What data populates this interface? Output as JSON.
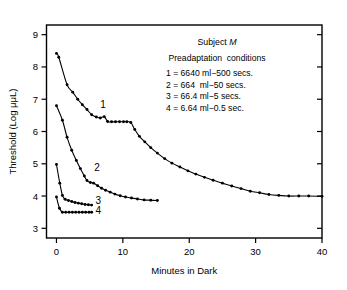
{
  "chart_data": {
    "type": "line",
    "title": "",
    "xlabel": "Minutes in Dark",
    "ylabel": "Threshold (Log μμL)",
    "xlim": [
      -1.5,
      40
    ],
    "ylim": [
      2.7,
      9.3
    ],
    "xticks": [
      0,
      10,
      20,
      30,
      40
    ],
    "yticks": [
      3,
      4,
      5,
      6,
      7,
      8,
      9
    ],
    "grid": false,
    "legend_position": "upper-right-inside",
    "marker": "filled-circle",
    "series": [
      {
        "name": "1",
        "label": "1 = 6640 ml−500 secs.",
        "points": [
          [
            0.0,
            8.42
          ],
          [
            0.35,
            8.3
          ],
          [
            1.6,
            7.45
          ],
          [
            2.45,
            7.22
          ],
          [
            3.2,
            7.0
          ],
          [
            3.9,
            6.83
          ],
          [
            4.6,
            6.68
          ],
          [
            5.3,
            6.52
          ],
          [
            6.0,
            6.45
          ],
          [
            6.6,
            6.42
          ],
          [
            7.2,
            6.46
          ],
          [
            7.7,
            6.31
          ],
          [
            8.3,
            6.3
          ],
          [
            8.9,
            6.3
          ],
          [
            9.5,
            6.3
          ],
          [
            10.1,
            6.3
          ],
          [
            10.6,
            6.3
          ],
          [
            11.2,
            6.28
          ],
          [
            11.8,
            6.06
          ],
          [
            12.5,
            5.85
          ],
          [
            13.3,
            5.68
          ],
          [
            14.2,
            5.5
          ],
          [
            15.2,
            5.33
          ],
          [
            16.3,
            5.16
          ],
          [
            17.4,
            5.02
          ],
          [
            18.6,
            4.9
          ],
          [
            19.8,
            4.78
          ],
          [
            21.0,
            4.68
          ],
          [
            22.3,
            4.58
          ],
          [
            23.6,
            4.49
          ],
          [
            25.0,
            4.4
          ],
          [
            26.4,
            4.31
          ],
          [
            27.8,
            4.23
          ],
          [
            29.2,
            4.15
          ],
          [
            30.6,
            4.1
          ],
          [
            32.0,
            4.05
          ],
          [
            33.5,
            4.02
          ],
          [
            35.0,
            4.0
          ],
          [
            36.5,
            4.0
          ],
          [
            38.0,
            4.0
          ],
          [
            40.0,
            3.99
          ]
        ]
      },
      {
        "name": "2",
        "label": "2 = 664 ml−50 secs.",
        "points": [
          [
            0.0,
            6.8
          ],
          [
            0.9,
            6.35
          ],
          [
            1.6,
            5.82
          ],
          [
            2.3,
            5.42
          ],
          [
            3.0,
            5.1
          ],
          [
            3.6,
            4.85
          ],
          [
            4.2,
            4.62
          ],
          [
            4.6,
            4.48
          ],
          [
            5.1,
            4.42
          ],
          [
            5.6,
            4.4
          ],
          [
            6.2,
            4.32
          ],
          [
            6.8,
            4.24
          ],
          [
            7.4,
            4.18
          ],
          [
            8.1,
            4.12
          ],
          [
            8.8,
            4.06
          ],
          [
            9.6,
            4.01
          ],
          [
            10.4,
            3.97
          ],
          [
            11.3,
            3.94
          ],
          [
            12.2,
            3.91
          ],
          [
            13.2,
            3.88
          ],
          [
            14.2,
            3.87
          ],
          [
            15.2,
            3.86
          ]
        ]
      },
      {
        "name": "3",
        "label": "3 = 66.4 ml−5 secs.",
        "points": [
          [
            0.0,
            4.98
          ],
          [
            0.5,
            4.4
          ],
          [
            0.9,
            4.02
          ],
          [
            1.3,
            3.9
          ],
          [
            1.8,
            3.86
          ],
          [
            2.3,
            3.83
          ],
          [
            2.8,
            3.8
          ],
          [
            3.3,
            3.78
          ],
          [
            3.8,
            3.76
          ],
          [
            4.3,
            3.74
          ],
          [
            4.8,
            3.73
          ],
          [
            5.3,
            3.72
          ]
        ]
      },
      {
        "name": "4",
        "label": "4 = 6.64 ml−0.5 sec.",
        "points": [
          [
            0.0,
            3.97
          ],
          [
            0.45,
            3.62
          ],
          [
            0.9,
            3.5
          ],
          [
            1.4,
            3.5
          ],
          [
            1.9,
            3.5
          ],
          [
            2.4,
            3.5
          ],
          [
            2.9,
            3.5
          ],
          [
            3.4,
            3.5
          ],
          [
            3.9,
            3.5
          ],
          [
            4.4,
            3.5
          ],
          [
            4.9,
            3.5
          ],
          [
            5.3,
            3.5
          ]
        ]
      }
    ],
    "curve_labels": [
      {
        "text": "1",
        "x": 7.0,
        "y": 6.72
      },
      {
        "text": "2",
        "x": 6.1,
        "y": 4.78
      },
      {
        "text": "3",
        "x": 6.3,
        "y": 3.74
      },
      {
        "text": "4",
        "x": 6.3,
        "y": 3.44
      }
    ],
    "annotations": {
      "subject_prefix": "Subject ",
      "subject_symbol": "M",
      "conditions_heading": "Preadaptation  conditions",
      "condition_lines": [
        "1 = 6640 ml−500 secs.",
        "2 = 664  ml−50 secs.",
        "3 = 66.4 ml−5 secs.",
        "4 = 6.64 ml−0.5 sec."
      ]
    },
    "colors": {
      "axis": "#000000",
      "curve": "#000000",
      "background": "#ffffff"
    }
  }
}
